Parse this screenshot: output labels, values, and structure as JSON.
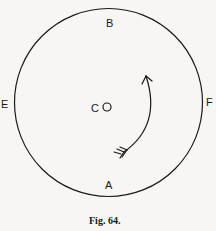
{
  "figure": {
    "caption": "Fig. 64.",
    "labels": {
      "top": "B",
      "bottom": "A",
      "left": "E",
      "right": "F",
      "center": "C"
    },
    "colors": {
      "ink": "#1a1a1a",
      "paper": "#f7f6f3"
    }
  }
}
